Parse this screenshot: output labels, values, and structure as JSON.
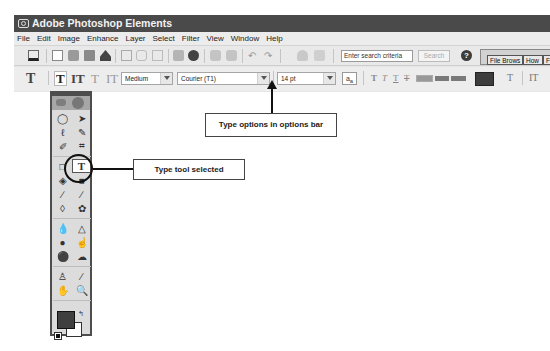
{
  "window": {
    "title": "Adobe Photoshop Elements"
  },
  "menubar": {
    "items": [
      "File",
      "Edit",
      "Image",
      "Enhance",
      "Layer",
      "Select",
      "Filter",
      "View",
      "Window",
      "Help"
    ]
  },
  "shortcuts_bar": {
    "icons": [
      "photo-bin-icon",
      "new-icon",
      "open-icon",
      "print-icon",
      "import-icon",
      "save-icon",
      "save-web-icon",
      "clipboard-icon",
      "quick-fix-icon",
      "photomerge-icon",
      "step-backward-icon",
      "step-forward-icon",
      "undo-icon",
      "redo-icon",
      "lock-icon",
      "clear-icon"
    ],
    "search_placeholder": "Enter search criteria",
    "search_button": "Search",
    "help_icon": "?",
    "palette_well_tabs": [
      "File Brows",
      "How",
      "F"
    ]
  },
  "options_bar": {
    "tool_icon": "T",
    "type_modes": [
      "T",
      "IT",
      "T",
      "IT"
    ],
    "font_style": "Medium",
    "font_family": "Courier (T1)",
    "font_size": "14 pt",
    "antialias": "a",
    "antialias_sub": "a",
    "style_buttons": [
      "T",
      "T",
      "T",
      "T"
    ],
    "text_color": "#3d3d3d",
    "warp_icon": "T",
    "orientation_icon": "IT"
  },
  "toolbox": {
    "tools": [
      [
        "marquee",
        "move"
      ],
      [
        "lasso",
        "magic-wand"
      ],
      [
        "selection-brush",
        "crop"
      ],
      [
        "shape",
        "type"
      ],
      [
        "paint-bucket",
        "gradient"
      ],
      [
        "brush",
        "pencil"
      ],
      [
        "eraser",
        "red-eye"
      ],
      [
        "blur",
        "sharpen"
      ],
      [
        "sponge",
        "smudge"
      ],
      [
        "zoom-dot",
        "color-replace"
      ],
      [
        "clone-stamp",
        "eyedropper"
      ],
      [
        "hand",
        "zoom"
      ]
    ],
    "type_tool_glyph": "T",
    "foreground_color": "#3f3f3f",
    "background_color": "#ffffff"
  },
  "callouts": {
    "type_tool": "Type tool selected",
    "options_bar": "Type options in options bar"
  }
}
